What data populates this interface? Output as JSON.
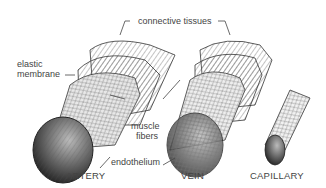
{
  "diagram": {
    "labels": {
      "connective_tissues": "connective tissues",
      "elastic": "elastic",
      "membrane": "membrane",
      "muscle": "muscle",
      "fibers": "fibers",
      "endothelium": "endothelium"
    },
    "captions": {
      "artery": "ARTERY",
      "vein": "VEIN",
      "capillary": "CAPILLARY"
    },
    "colors": {
      "ink": "#333333",
      "background": "#ffffff"
    }
  }
}
